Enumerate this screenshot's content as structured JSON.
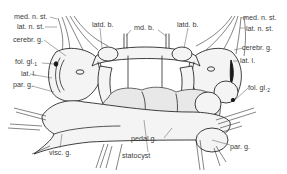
{
  "diagram": {
    "type": "anatomical-line-drawing",
    "labels_left": [
      {
        "id": "med_n_st_l",
        "text": "med. n. st."
      },
      {
        "id": "lat_n_st_l",
        "text": "lat. n. st."
      },
      {
        "id": "cerebr_g_l",
        "text": "cerebr. g."
      },
      {
        "id": "fol_gl_1",
        "text": "fol. gl.",
        "sub": "1"
      },
      {
        "id": "lat_l_l",
        "text": "lat. l."
      },
      {
        "id": "par_g_l",
        "text": "par. g."
      },
      {
        "id": "visc_g",
        "text": "visc. g."
      }
    ],
    "labels_top": [
      {
        "id": "latd_b_l",
        "text": "latd. b."
      },
      {
        "id": "md_b",
        "text": "md. b."
      },
      {
        "id": "latd_b_r",
        "text": "latd. b."
      }
    ],
    "labels_right": [
      {
        "id": "med_n_st_r",
        "text": "med. n. st."
      },
      {
        "id": "lat_n_st_r",
        "text": "lat. n. st."
      },
      {
        "id": "cerebr_g_r",
        "text": "cerebr. g."
      },
      {
        "id": "lat_l_r",
        "text": "lat. l."
      },
      {
        "id": "fol_gl_2",
        "text": "fol. gl.",
        "sub": "2"
      },
      {
        "id": "par_g_r",
        "text": "par. g."
      }
    ],
    "labels_bottom": [
      {
        "id": "pedal_g",
        "text": "pedal g."
      },
      {
        "id": "statocyst",
        "text": "statocyst"
      }
    ],
    "colors": {
      "line": "#2a2a2a",
      "fill": "#f4f4f4",
      "label": "#3a3a3a",
      "background": "#ffffff"
    }
  }
}
